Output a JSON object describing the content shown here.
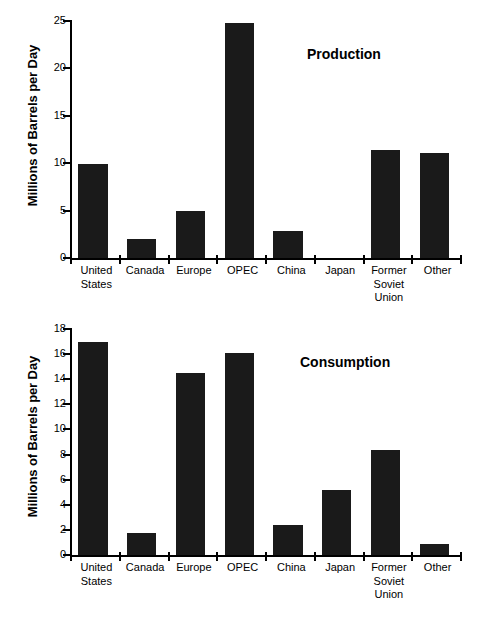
{
  "chart_data": [
    {
      "type": "bar",
      "title": "Production",
      "xlabel": "",
      "ylabel": "Millions of Barrels per Day",
      "ylim": [
        0,
        25
      ],
      "yticks": [
        0,
        5,
        10,
        15,
        20,
        25
      ],
      "grid": false,
      "legend": null,
      "categories": [
        "United\nStates",
        "Canada",
        "Europe",
        "OPEC",
        "China",
        "Japan",
        "Former\nSoviet\nUnion",
        "Other"
      ],
      "category_lines": [
        [
          "United",
          "States"
        ],
        [
          "Canada"
        ],
        [
          "Europe"
        ],
        [
          "OPEC"
        ],
        [
          "China"
        ],
        [
          "Japan"
        ],
        [
          "Former",
          "Soviet",
          "Union"
        ],
        [
          "Other"
        ]
      ],
      "values": [
        9.9,
        2.0,
        5.0,
        24.8,
        2.9,
        0.0,
        11.4,
        11.1
      ],
      "bar_color": "#1a1a1a"
    },
    {
      "type": "bar",
      "title": "Consumption",
      "xlabel": "",
      "ylabel": "Millions of Barrels per Day",
      "ylim": [
        0,
        18
      ],
      "yticks": [
        0,
        2,
        4,
        6,
        8,
        10,
        12,
        14,
        16,
        18
      ],
      "grid": false,
      "legend": null,
      "categories": [
        "United\nStates",
        "Canada",
        "Europe",
        "OPEC",
        "China",
        "Japan",
        "Former\nSoviet\nUnion",
        "Other"
      ],
      "category_lines": [
        [
          "United",
          "States"
        ],
        [
          "Canada"
        ],
        [
          "Europe"
        ],
        [
          "OPEC"
        ],
        [
          "China"
        ],
        [
          "Japan"
        ],
        [
          "Former",
          "Soviet",
          "Union"
        ],
        [
          "Other"
        ]
      ],
      "values": [
        17.0,
        1.75,
        14.5,
        16.1,
        2.4,
        5.2,
        8.4,
        0.9
      ],
      "bar_color": "#1a1a1a"
    }
  ],
  "figure": {
    "background": "#ffffff",
    "ink_color": "#000000",
    "panels": [
      {
        "id": "production",
        "title": "Production",
        "ylabel": "Millions of Barrels per Day"
      },
      {
        "id": "consumption",
        "title": "Consumption",
        "ylabel": "Millions of Barrels per Day"
      }
    ]
  }
}
